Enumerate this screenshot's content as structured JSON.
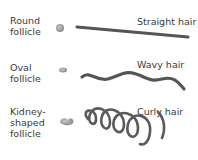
{
  "rows": [
    {
      "follicle": "Round follicle",
      "follicle_lines": [
        "Round",
        "follicle"
      ],
      "hair": "Straight hair"
    },
    {
      "follicle": "Oval follicle",
      "follicle_lines": [
        "Oval",
        "follicle"
      ],
      "hair": "Wavy hair"
    },
    {
      "follicle": "Kidney-shaped follicle",
      "follicle_lines": [
        "Kidney-",
        "shaped",
        "follicle"
      ],
      "hair": "Curly hair"
    }
  ],
  "colors": {
    "hair": "#555555",
    "follicle": "#999999",
    "text": "#3a3a3a"
  }
}
